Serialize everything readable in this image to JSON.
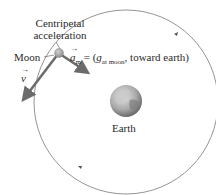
{
  "diagram": {
    "labels": {
      "centripetal_line1": "Centripetal",
      "centripetal_line2": "acceleration",
      "moon": "Moon",
      "velocity_symbol": "v",
      "accel_symbol": "a",
      "accel_subscript": "m",
      "accel_equals": "= (",
      "g_symbol": "g",
      "g_subscript": "at moon",
      "accel_direction": ", toward earth)",
      "earth": "Earth"
    },
    "colors": {
      "orbit": "#7a7a7a",
      "vector_arrows": "#6b6b6b",
      "moon": "#a8a8a8",
      "earth_light": "#d4d4d4",
      "earth_dark": "#6e6e6e"
    }
  }
}
